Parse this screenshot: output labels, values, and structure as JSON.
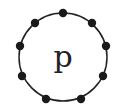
{
  "diagram": {
    "center_label": "p",
    "circle": {
      "cx": 63,
      "cy": 57,
      "r": 44,
      "stroke": "#222222"
    },
    "nodes": [
      {
        "x": 63,
        "y": 13
      },
      {
        "x": 92,
        "y": 23
      },
      {
        "x": 106,
        "y": 46
      },
      {
        "x": 103,
        "y": 76
      },
      {
        "x": 81,
        "y": 99
      },
      {
        "x": 46,
        "y": 99
      },
      {
        "x": 22,
        "y": 76
      },
      {
        "x": 20,
        "y": 46
      },
      {
        "x": 35,
        "y": 23
      }
    ],
    "node_color": "#1a1a1a"
  }
}
